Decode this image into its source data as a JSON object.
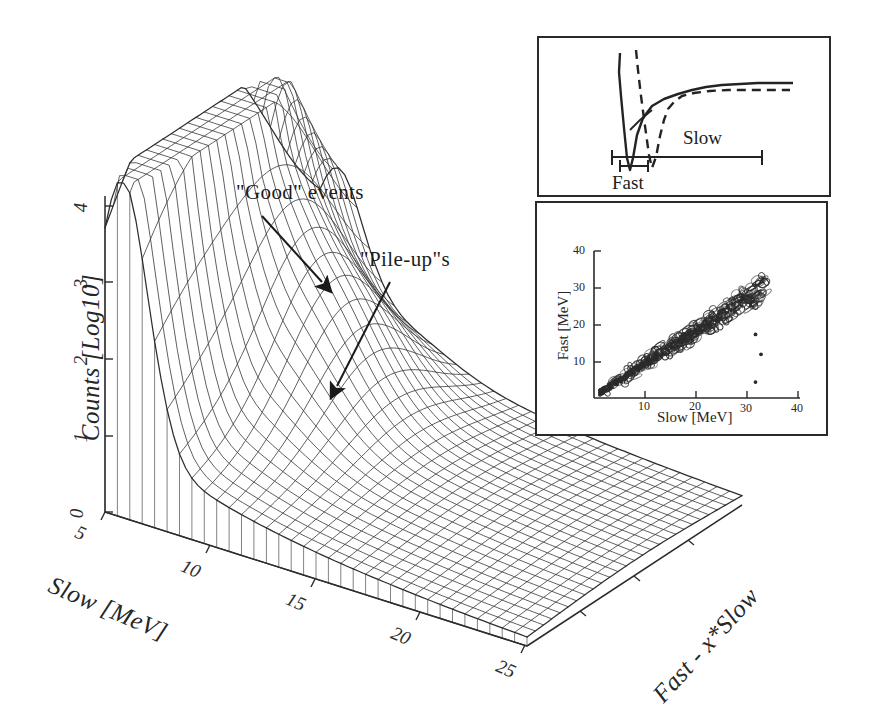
{
  "figure": {
    "kind": "scientific-figure",
    "background": "#ffffff",
    "ink": "#1f1f1f"
  },
  "chart_data": {
    "type": "surface-3d-wireframe",
    "title": "",
    "xlabel": "Slow [MeV]",
    "ylabel": "Counts [Log10]",
    "zlabel": "Fast - x*Slow",
    "xticks": [
      "5",
      "10",
      "15",
      "20",
      "25"
    ],
    "yticks": [
      "0",
      "1",
      "2",
      "3",
      "4"
    ],
    "xlim": [
      5,
      27
    ],
    "ylim": [
      0,
      4.4
    ],
    "grid": true,
    "legend": "none",
    "annotations": [
      {
        "label": "\"Good\" events",
        "text_x": 236,
        "text_y": 196,
        "arrow_from_x": 262,
        "arrow_from_y": 216,
        "arrow_to_x": 323,
        "arrow_to_y": 283
      },
      {
        "label": "\"Pile-up\"s",
        "text_x": 360,
        "text_y": 262,
        "arrow_from_x": 390,
        "arrow_from_y": 282,
        "arrow_to_x": 335,
        "arrow_to_y": 388
      }
    ],
    "series": [
      {
        "name": "Good events ridge",
        "peak_x": 6.0,
        "peak_y": 4.3,
        "comment": "sharp high ridge near the low Slow edge"
      },
      {
        "name": "Pile-up shoulder",
        "peak_x": 9.5,
        "peak_y": 2.1,
        "comment": "secondary lower ridge offset in Fast - x*Slow"
      }
    ]
  },
  "insets": [
    {
      "id": "pulse-shape",
      "type": "line",
      "title": "",
      "description": "Detector pulse traces (one solid, one dashed) showing fast falling edge and slow recovery tail, with integration gates marked underneath.",
      "gates": [
        {
          "label": "Fast",
          "x0": 620,
          "x1": 648,
          "label_pos": "below"
        },
        {
          "label": "Slow",
          "x0": 612,
          "x1": 762,
          "label_pos": "above"
        }
      ],
      "series": [
        {
          "name": "trace-solid",
          "style": "solid"
        },
        {
          "name": "trace-dashed",
          "style": "dashed"
        }
      ]
    },
    {
      "id": "fast-vs-slow",
      "type": "scatter",
      "title": "",
      "xlabel": "Slow [MeV]",
      "ylabel": "Fast [MeV]",
      "xticks": [
        "10",
        "20",
        "30",
        "40"
      ],
      "yticks": [
        "10",
        "20",
        "30",
        "40"
      ],
      "xlim": [
        4,
        41
      ],
      "ylim": [
        4,
        41
      ],
      "grid": false,
      "description": "Dense correlated band of events along the Fast = Slow diagonal from about 5 MeV to 35 MeV, with a few scattered outlier points below the band near 33-35 MeV Slow.",
      "outliers": [
        {
          "slow": 33,
          "fast": 20
        },
        {
          "slow": 34,
          "fast": 15
        },
        {
          "slow": 33,
          "fast": 8
        }
      ]
    }
  ]
}
